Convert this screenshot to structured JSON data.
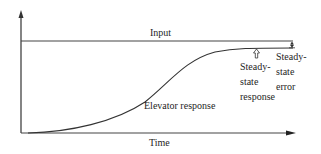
{
  "diagram": {
    "type": "step-response",
    "labels": {
      "input": "Input",
      "time": "Time",
      "elevator_response": "Elevator response",
      "steady_state_response": [
        "Steady-",
        "state",
        "response"
      ],
      "steady_state_error": [
        "Steady-",
        "state",
        "error"
      ]
    },
    "elements": {
      "y_axis": "vertical axis with arrow",
      "x_axis": "time axis with arrow",
      "input_line": "horizontal step input level",
      "response_curve": "S-shaped response approaching steady state below input",
      "steady_state_marker": "hollow up-arrow-icon",
      "error_marker": "double-headed arrow between input and steady state"
    },
    "colors": {
      "line": "#333333",
      "text": "#1e1e1e",
      "background": "#ffffff"
    }
  }
}
